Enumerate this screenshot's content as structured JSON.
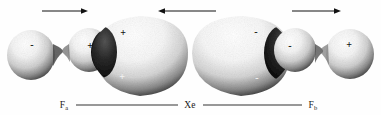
{
  "figure": {
    "background_color": "#fefefe",
    "ink_color": "#1a1a1a"
  },
  "arrows": [
    {
      "name": "left-fluorine-displacement-arrow",
      "direction": "right",
      "x1": 42,
      "x2": 88,
      "y": 11
    },
    {
      "name": "xenon-displacement-arrow",
      "direction": "left",
      "x1": 158,
      "x2": 216,
      "y": 11
    },
    {
      "name": "right-fluorine-displacement-arrow",
      "direction": "right",
      "x1": 292,
      "x2": 341,
      "y": 11
    }
  ],
  "orbitals": [
    {
      "name": "fluorine-a-outer-lobe",
      "center_x": 31,
      "center_y": 55,
      "radius_x": 24,
      "radius_y": 25,
      "phase": "-",
      "sign_x": 32,
      "sign_y": 45,
      "sign_tone": "light"
    },
    {
      "name": "fluorine-a-inner-lobe",
      "center_x": 89,
      "center_y": 50,
      "radius_x": 21,
      "radius_y": 22,
      "phase": "+",
      "sign_x": 90,
      "sign_y": 46,
      "sign_tone": "light"
    },
    {
      "name": "xenon-left-lobe",
      "center_x": 140,
      "center_y": 53,
      "radius_x": 48,
      "radius_y": 37,
      "phase": "+",
      "sign_x": 123,
      "sign_y": 33,
      "sign_tone": "light",
      "sign2_x": 122,
      "sign2_y": 77,
      "sign2_tone": "dark"
    },
    {
      "name": "xenon-right-lobe",
      "center_x": 241,
      "center_y": 53,
      "radius_x": 49,
      "radius_y": 37,
      "phase": "-",
      "sign_x": 256,
      "sign_y": 32,
      "sign_tone": "light",
      "sign2_x": 257,
      "sign2_y": 78,
      "sign2_tone": "dark"
    },
    {
      "name": "fluorine-b-inner-lobe",
      "center_x": 295,
      "center_y": 50,
      "radius_x": 21,
      "radius_y": 22,
      "phase": "-",
      "sign_x": 290,
      "sign_y": 46,
      "sign_tone": "light"
    },
    {
      "name": "fluorine-b-outer-lobe",
      "center_x": 350,
      "center_y": 54,
      "radius_x": 24,
      "radius_y": 25,
      "phase": "+",
      "sign_x": 349,
      "sign_y": 45,
      "sign_tone": "light"
    }
  ],
  "axis": {
    "baseline_y": 105,
    "labels": [
      {
        "name": "atom-label-fluorine-a",
        "text": "F",
        "subscript": "a",
        "x": 64
      },
      {
        "name": "atom-label-xenon",
        "text": "Xe",
        "subscript": "",
        "x": 190
      },
      {
        "name": "atom-label-fluorine-b",
        "text": "F",
        "subscript": "b",
        "x": 313
      }
    ],
    "rules": [
      {
        "name": "bond-rule-left",
        "x1": 76,
        "x2": 178
      },
      {
        "name": "bond-rule-right",
        "x1": 203,
        "x2": 302
      }
    ]
  }
}
